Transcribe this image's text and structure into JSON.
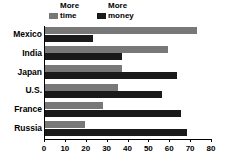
{
  "chart_data": {
    "type": "bar",
    "orientation": "horizontal",
    "title": "",
    "subtitle": "",
    "xlabel": "",
    "ylabel": "",
    "xlim": [
      0,
      80
    ],
    "xticks": [
      0,
      10,
      20,
      30,
      40,
      50,
      60,
      70,
      80
    ],
    "xtick_labels": [
      "0",
      "10",
      "20",
      "30",
      "40",
      "50",
      "60",
      "70",
      "80"
    ],
    "grid": false,
    "legend_position": "top-left",
    "categories": [
      "Mexico",
      "India",
      "Japan",
      "U.S.",
      "France",
      "Russia"
    ],
    "series": [
      {
        "name": "More time",
        "label_line1": "More",
        "label_line2": "time",
        "color": "#787878",
        "values": [
          73,
          59,
          37,
          35,
          28,
          19
        ]
      },
      {
        "name": "More money",
        "label_line1": "More",
        "label_line2": "money",
        "color": "#1a1a1a",
        "values": [
          23,
          37,
          63,
          56,
          65,
          68
        ]
      }
    ]
  }
}
